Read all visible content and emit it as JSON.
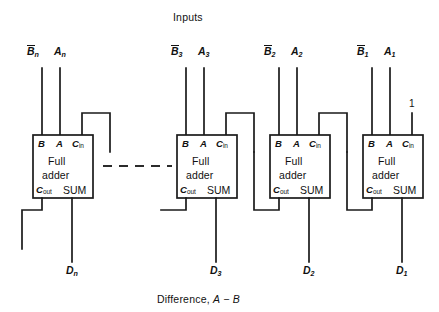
{
  "figure": {
    "title": "Inputs",
    "caption_prefix": "Difference,",
    "caption_a": "A",
    "caption_minus": "−",
    "caption_b": "B",
    "background": "#ffffff",
    "ink": "#1a1a1a"
  },
  "pins": {
    "b": "B",
    "a": "A",
    "cin_c": "C",
    "cin_sub": "in",
    "cout_c": "C",
    "cout_sub": "out",
    "sum": "SUM",
    "line1": "Full",
    "line2": "adder"
  },
  "carry_in_constant": "1",
  "stages": [
    {
      "name": "stage-n",
      "b_label": "B",
      "b_sub": "n",
      "a_label": "A",
      "a_sub": "n",
      "d_label": "D",
      "d_sub": "n",
      "box_x": 33,
      "box_y": 135
    },
    {
      "name": "stage-3",
      "b_label": "B",
      "b_sub": "3",
      "a_label": "A",
      "a_sub": "3",
      "d_label": "D",
      "d_sub": "3",
      "box_x": 177,
      "box_y": 135
    },
    {
      "name": "stage-2",
      "b_label": "B",
      "b_sub": "2",
      "a_label": "A",
      "a_sub": "2",
      "d_label": "D",
      "d_sub": "2",
      "box_x": 270,
      "box_y": 135
    },
    {
      "name": "stage-1",
      "b_label": "B",
      "b_sub": "1",
      "a_label": "A",
      "a_sub": "1",
      "d_label": "D",
      "d_sub": "1",
      "box_x": 363,
      "box_y": 135
    }
  ]
}
